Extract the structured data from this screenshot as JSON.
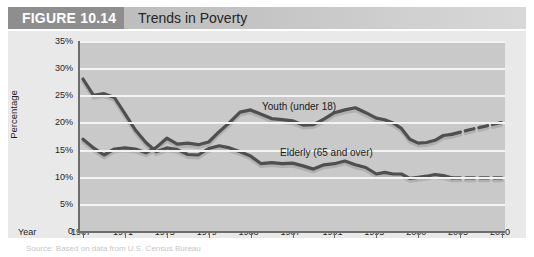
{
  "header": {
    "figure_label": "FIGURE 10.14",
    "title": "Trends in Poverty",
    "box_color": "#8e8e8e",
    "band_color": "#c9c9c9"
  },
  "caption": {
    "text": "Source: Based on data from U.S. Census Bureau"
  },
  "chart_data": {
    "type": "line",
    "title": "Trends in Poverty",
    "xlabel": "Year",
    "ylabel": "Percentage",
    "ylim": [
      0,
      35
    ],
    "ytick_labels": [
      "0",
      "5%",
      "10%",
      "15%",
      "20%",
      "25%",
      "30%",
      "35%"
    ],
    "ytick_values": [
      0,
      5,
      10,
      15,
      20,
      25,
      30,
      35
    ],
    "xtick_labels": [
      "1967",
      "1971",
      "1975",
      "1979",
      "1983",
      "1987",
      "1991",
      "1995",
      "2000",
      "2005",
      "2010"
    ],
    "xtick_values": [
      1967,
      1971,
      1975,
      1979,
      1983,
      1987,
      1991,
      1995,
      2000,
      2005,
      2010
    ],
    "xlim": [
      1967,
      2010
    ],
    "grid": "horizontal",
    "legend": "inline-annotations",
    "line_color": "#4f4f4f",
    "shadow_color": "#b0b0b0",
    "series": [
      {
        "name": "Youth (under 18)",
        "annotation": "Youth (under 18)",
        "x": [
          1967,
          1968,
          1969,
          1970,
          1971,
          1972,
          1973,
          1974,
          1975,
          1976,
          1977,
          1978,
          1979,
          1980,
          1981,
          1982,
          1983,
          1984,
          1985,
          1986,
          1987,
          1988,
          1989,
          1990,
          1991,
          1992,
          1993,
          1994,
          1995,
          1996,
          1997,
          1998,
          1999,
          2000,
          2001,
          2002,
          2003,
          2004
        ],
        "values": [
          16.9,
          15.3,
          14.0,
          15.1,
          15.3,
          15.1,
          14.4,
          15.4,
          17.1,
          16.0,
          16.2,
          15.9,
          16.4,
          18.3,
          20.0,
          21.9,
          22.3,
          21.5,
          20.7,
          20.5,
          20.3,
          19.5,
          19.6,
          20.6,
          21.8,
          22.3,
          22.7,
          21.8,
          20.8,
          20.5,
          19.9,
          18.9,
          16.9,
          16.2,
          16.3,
          16.7,
          17.6,
          17.8
        ],
        "style": "solid"
      },
      {
        "name": "Youth (under 18) projected",
        "x": [
          2004,
          2006,
          2008,
          2010
        ],
        "values": [
          17.8,
          18.6,
          19.3,
          20.0
        ],
        "style": "dashed"
      },
      {
        "name": "Elderly (65 and over)",
        "annotation": "Elderly (65 and over)",
        "x": [
          1967,
          1968,
          1969,
          1970,
          1971,
          1972,
          1973,
          1974,
          1975,
          1976,
          1977,
          1978,
          1979,
          1980,
          1981,
          1982,
          1983,
          1984,
          1985,
          1986,
          1987,
          1988,
          1989,
          1990,
          1991,
          1992,
          1993,
          1994,
          1995,
          1996,
          1997,
          1998,
          1999,
          2000,
          2001,
          2002,
          2003,
          2004
        ],
        "values": [
          28.0,
          25.0,
          25.3,
          24.6,
          21.6,
          18.6,
          16.3,
          14.6,
          15.3,
          15.0,
          14.1,
          14.0,
          15.2,
          15.7,
          15.3,
          14.6,
          13.8,
          12.4,
          12.6,
          12.4,
          12.5,
          12.0,
          11.4,
          12.2,
          12.4,
          12.9,
          12.2,
          11.7,
          10.5,
          10.8,
          10.5,
          10.5,
          9.7,
          9.9,
          10.1,
          10.4,
          10.2,
          9.8
        ],
        "style": "solid"
      },
      {
        "name": "Elderly (65 and over) projected",
        "x": [
          2004,
          2006,
          2008,
          2010
        ],
        "values": [
          9.8,
          9.8,
          9.8,
          9.8
        ],
        "style": "dashed"
      }
    ]
  }
}
